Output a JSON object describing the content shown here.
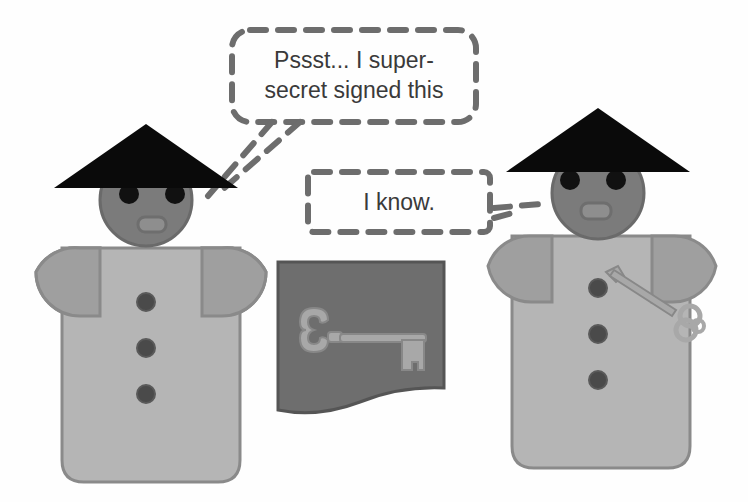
{
  "scene": {
    "description": "Two cartoon figures with conical hats; one whispers to the other about a signed document with a key",
    "colors": {
      "background": "#fefefe",
      "hat": "#0a0a0a",
      "head": "#7b7b7b",
      "head_outline": "#6a6a6a",
      "eyes": "#111111",
      "mouth": "#8e8e8e",
      "body": "#b5b5b5",
      "body_outline": "#8a8a8a",
      "arms": "#9f9f9f",
      "buttons": "#4a4a4a",
      "document": "#6e6e6e",
      "document_outline": "#555555",
      "key": "#a8a8a8",
      "key_outline": "#888888",
      "dash_stroke": "#6d6d6d",
      "text": "#3a3a3a"
    }
  },
  "speech_bubbles": [
    {
      "speaker": "left-person",
      "line1": "Pssst... I super-",
      "line2": "secret signed this"
    },
    {
      "speaker": "right-person",
      "line1": "I know."
    }
  ],
  "figures": [
    {
      "name": "left-person",
      "buttons": 3,
      "holds_key": false
    },
    {
      "name": "right-person",
      "buttons": 3,
      "holds_key": true
    }
  ],
  "document": {
    "name": "signed-document",
    "emblem": "key"
  }
}
